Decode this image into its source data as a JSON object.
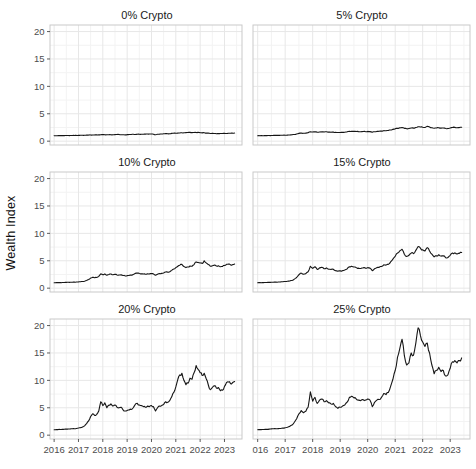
{
  "figure": {
    "kind": "faceted line chart (wealth index vs year for crypto allocations)",
    "background": "#ffffff"
  },
  "style": {
    "line_color": "#161616",
    "line_width": 1.1,
    "grid_major_color": "#e7e7e7",
    "grid_minor_color": "#f3f3f3",
    "panel_border_color": "#c9c9c9",
    "panel_fill": "#ffffff",
    "tick_mark_color": "#333333",
    "tick_label_color": "#4d4d4d",
    "facet_title_color": "#1a1a1a"
  },
  "chart_data": {
    "type": "line",
    "title": "",
    "xlabel": "",
    "ylabel": "Wealth Index",
    "legend": "none",
    "grid": "major+minor",
    "x_ticks": [
      2016,
      2017,
      2018,
      2019,
      2020,
      2021,
      2022,
      2023
    ],
    "x_tick_labels": [
      "2016",
      "2017",
      "2018",
      "2019",
      "2020",
      "2021",
      "2022",
      "2023"
    ],
    "y_ticks": [
      0,
      5,
      10,
      15,
      20
    ],
    "y_tick_labels": [
      "0",
      "5",
      "10",
      "15",
      "20"
    ],
    "xlim": [
      2015.83,
      2023.72
    ],
    "ylim": [
      -0.7,
      21.2
    ],
    "x_start_year": 2016,
    "x_points_per_year": 12,
    "facets": [
      {
        "title": "0% Crypto",
        "values": [
          1.0,
          1.0,
          1.01,
          1.01,
          1.02,
          1.02,
          1.03,
          1.03,
          1.03,
          1.04,
          1.04,
          1.05,
          1.06,
          1.07,
          1.08,
          1.09,
          1.1,
          1.11,
          1.12,
          1.13,
          1.14,
          1.15,
          1.16,
          1.17,
          1.19,
          1.17,
          1.16,
          1.17,
          1.18,
          1.18,
          1.2,
          1.21,
          1.21,
          1.17,
          1.18,
          1.14,
          1.19,
          1.21,
          1.22,
          1.25,
          1.22,
          1.26,
          1.27,
          1.26,
          1.27,
          1.28,
          1.3,
          1.32,
          1.32,
          1.27,
          1.17,
          1.25,
          1.28,
          1.3,
          1.34,
          1.38,
          1.36,
          1.35,
          1.42,
          1.46,
          1.45,
          1.47,
          1.5,
          1.53,
          1.54,
          1.56,
          1.58,
          1.6,
          1.56,
          1.59,
          1.58,
          1.61,
          1.55,
          1.52,
          1.53,
          1.46,
          1.46,
          1.4,
          1.44,
          1.41,
          1.35,
          1.37,
          1.41,
          1.39,
          1.43,
          1.41,
          1.44,
          1.45,
          1.46,
          1.48
        ]
      },
      {
        "title": "5% Crypto",
        "values": [
          1.0,
          1.0,
          1.01,
          1.02,
          1.02,
          1.03,
          1.04,
          1.05,
          1.05,
          1.06,
          1.07,
          1.08,
          1.09,
          1.11,
          1.13,
          1.16,
          1.22,
          1.3,
          1.42,
          1.48,
          1.44,
          1.46,
          1.55,
          1.72,
          1.66,
          1.72,
          1.62,
          1.68,
          1.72,
          1.66,
          1.71,
          1.65,
          1.64,
          1.65,
          1.6,
          1.57,
          1.59,
          1.61,
          1.64,
          1.7,
          1.79,
          1.82,
          1.78,
          1.76,
          1.74,
          1.73,
          1.76,
          1.75,
          1.78,
          1.74,
          1.62,
          1.72,
          1.78,
          1.8,
          1.84,
          1.92,
          1.91,
          1.95,
          2.05,
          2.15,
          2.25,
          2.35,
          2.43,
          2.5,
          2.34,
          2.26,
          2.31,
          2.4,
          2.38,
          2.5,
          2.63,
          2.58,
          2.54,
          2.5,
          2.72,
          2.58,
          2.46,
          2.36,
          2.41,
          2.45,
          2.38,
          2.4,
          2.3,
          2.32,
          2.4,
          2.5,
          2.52,
          2.46,
          2.48,
          2.55
        ]
      },
      {
        "title": "10% Crypto",
        "values": [
          1.0,
          1.01,
          1.01,
          1.02,
          1.03,
          1.04,
          1.05,
          1.07,
          1.08,
          1.08,
          1.1,
          1.12,
          1.14,
          1.17,
          1.21,
          1.27,
          1.4,
          1.58,
          1.85,
          2.0,
          1.9,
          1.95,
          2.15,
          2.6,
          2.45,
          2.6,
          2.35,
          2.5,
          2.58,
          2.45,
          2.55,
          2.42,
          2.4,
          2.42,
          2.3,
          2.25,
          2.28,
          2.32,
          2.38,
          2.5,
          2.7,
          2.75,
          2.68,
          2.62,
          2.58,
          2.55,
          2.62,
          2.6,
          2.66,
          2.6,
          2.35,
          2.55,
          2.66,
          2.7,
          2.78,
          2.95,
          2.92,
          3.0,
          3.25,
          3.5,
          3.75,
          4.0,
          4.2,
          4.35,
          3.95,
          3.75,
          3.85,
          4.05,
          4.0,
          4.3,
          4.8,
          4.7,
          4.6,
          4.5,
          5.0,
          4.6,
          4.3,
          4.0,
          4.1,
          4.2,
          4.05,
          4.1,
          3.9,
          3.95,
          4.15,
          4.35,
          4.4,
          4.25,
          4.3,
          4.4
        ]
      },
      {
        "title": "15% Crypto",
        "values": [
          1.0,
          1.01,
          1.02,
          1.03,
          1.04,
          1.06,
          1.08,
          1.1,
          1.11,
          1.12,
          1.14,
          1.17,
          1.21,
          1.25,
          1.32,
          1.42,
          1.65,
          1.95,
          2.45,
          2.75,
          2.55,
          2.65,
          3.0,
          4.0,
          3.6,
          3.9,
          3.4,
          3.7,
          3.8,
          3.55,
          3.7,
          3.45,
          3.4,
          3.45,
          3.2,
          3.1,
          3.15,
          3.2,
          3.3,
          3.5,
          3.9,
          4.0,
          3.85,
          3.75,
          3.65,
          3.6,
          3.7,
          3.65,
          3.75,
          3.65,
          3.2,
          3.55,
          3.75,
          3.8,
          3.95,
          4.25,
          4.2,
          4.35,
          4.8,
          5.3,
          5.8,
          6.4,
          6.8,
          7.1,
          6.2,
          5.8,
          6.0,
          6.4,
          6.3,
          6.9,
          7.6,
          7.3,
          7.0,
          6.8,
          7.4,
          6.8,
          6.2,
          5.7,
          5.9,
          6.1,
          5.85,
          5.9,
          5.55,
          5.6,
          6.0,
          6.4,
          6.45,
          6.25,
          6.35,
          6.5
        ]
      },
      {
        "title": "20% Crypto",
        "values": [
          1.0,
          1.01,
          1.02,
          1.04,
          1.05,
          1.08,
          1.11,
          1.13,
          1.14,
          1.16,
          1.18,
          1.22,
          1.3,
          1.38,
          1.5,
          1.7,
          2.1,
          2.6,
          3.4,
          3.9,
          3.6,
          3.8,
          4.4,
          6.1,
          5.4,
          5.9,
          5.0,
          5.5,
          5.7,
          5.3,
          5.5,
          5.1,
          5.0,
          5.1,
          4.6,
          4.4,
          4.5,
          4.6,
          4.7,
          5.0,
          5.6,
          5.8,
          5.5,
          5.4,
          5.2,
          5.1,
          5.3,
          5.2,
          5.4,
          5.2,
          4.4,
          5.0,
          5.3,
          5.4,
          5.6,
          6.1,
          6.0,
          6.3,
          7.0,
          7.8,
          8.8,
          10.2,
          11.0,
          11.3,
          10.0,
          9.2,
          9.5,
          10.4,
          10.2,
          11.4,
          12.7,
          12.0,
          11.4,
          10.9,
          11.3,
          10.3,
          9.2,
          8.3,
          8.7,
          9.0,
          8.6,
          8.7,
          8.1,
          8.2,
          8.9,
          9.6,
          9.7,
          9.4,
          9.6,
          9.8
        ]
      },
      {
        "title": "25% Crypto",
        "values": [
          1.0,
          1.02,
          1.03,
          1.05,
          1.06,
          1.1,
          1.14,
          1.16,
          1.18,
          1.2,
          1.22,
          1.28,
          1.35,
          1.45,
          1.6,
          1.85,
          2.35,
          3.0,
          3.9,
          4.5,
          4.1,
          4.35,
          5.1,
          7.9,
          6.2,
          6.9,
          5.8,
          6.4,
          6.6,
          6.1,
          6.3,
          5.9,
          5.7,
          5.8,
          5.2,
          4.9,
          5.1,
          5.3,
          5.5,
          6.0,
          6.9,
          7.1,
          6.8,
          6.6,
          6.4,
          6.3,
          6.5,
          6.4,
          6.6,
          6.4,
          5.2,
          6.0,
          6.4,
          6.5,
          6.9,
          7.6,
          7.4,
          7.8,
          8.9,
          10.2,
          11.8,
          14.2,
          15.8,
          17.5,
          14.5,
          12.8,
          13.2,
          15.0,
          14.6,
          16.8,
          19.6,
          18.2,
          17.0,
          16.2,
          16.8,
          15.0,
          12.8,
          11.2,
          11.8,
          12.4,
          11.6,
          11.8,
          10.8,
          11.0,
          12.2,
          13.4,
          13.6,
          13.2,
          13.6,
          14.1
        ]
      }
    ]
  }
}
